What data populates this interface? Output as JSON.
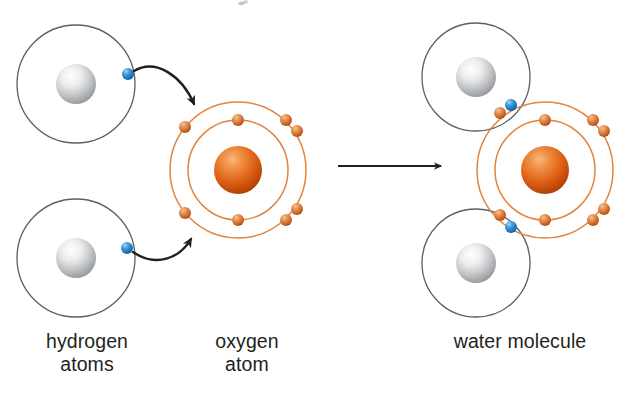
{
  "figure": {
    "background": "#ffffff",
    "width": 624,
    "height": 402
  },
  "colors": {
    "hydrogen_shell_stroke": "#5a5f66",
    "hydrogen_nucleus_light": "#ffffff",
    "hydrogen_nucleus_mid": "#c9cacb",
    "hydrogen_nucleus_dark": "#8d9094",
    "oxygen_shell_stroke": "#e2843c",
    "oxygen_nucleus_light": "#f0a05a",
    "oxygen_nucleus_mid": "#de5f14",
    "oxygen_nucleus_dark": "#b03c07",
    "oxygen_electron_light": "#f0a163",
    "oxygen_electron_mid": "#d2622a",
    "oxygen_electron_dark": "#a2430f",
    "shared_electron_light": "#7fc4e8",
    "shared_electron_mid": "#1f7fc4",
    "shared_electron_dark": "#11558a",
    "arrow": "#231f20",
    "caption_text": "#231f20"
  },
  "labels": {
    "hydrogen_atoms": "hydrogen\natoms",
    "oxygen_atom": "oxygen\natom",
    "water_molecule": "water molecule"
  },
  "icons": {
    "reaction_arrow": "right-arrow-icon",
    "electron_transfer_upper": "curved-arrow-icon",
    "electron_transfer_lower": "curved-arrow-icon"
  },
  "reactants": {
    "hydrogen_atoms": [
      {
        "name": "hydrogen-atom-upper",
        "shell": {
          "cx": 76,
          "cy": 84,
          "r": 59
        },
        "nucleus": {
          "cx": 76,
          "cy": 84,
          "r": 20
        },
        "electrons": [
          {
            "cx": 128,
            "cy": 74,
            "r": 6,
            "type": "shared"
          }
        ]
      },
      {
        "name": "hydrogen-atom-lower",
        "shell": {
          "cx": 76,
          "cy": 258,
          "r": 59
        },
        "nucleus": {
          "cx": 76,
          "cy": 258,
          "r": 20
        },
        "electrons": [
          {
            "cx": 127,
            "cy": 248,
            "r": 6,
            "type": "shared"
          }
        ]
      }
    ],
    "oxygen_atom": {
      "name": "oxygen-atom",
      "nucleus": {
        "cx": 238,
        "cy": 170,
        "r": 24
      },
      "inner_shell": {
        "cx": 238,
        "cy": 170,
        "r": 50
      },
      "outer_shell": {
        "cx": 238,
        "cy": 170,
        "r": 68
      },
      "inner_electrons": [
        {
          "cx": 238,
          "cy": 120,
          "r": 6
        },
        {
          "cx": 238,
          "cy": 220,
          "r": 6
        }
      ],
      "outer_electrons": [
        {
          "cx": 185,
          "cy": 127,
          "r": 6
        },
        {
          "cx": 185,
          "cy": 213,
          "r": 6
        },
        {
          "cx": 286,
          "cy": 120,
          "r": 6
        },
        {
          "cx": 297,
          "cy": 131,
          "r": 6
        },
        {
          "cx": 297,
          "cy": 209,
          "r": 6
        },
        {
          "cx": 286,
          "cy": 220,
          "r": 6
        }
      ]
    }
  },
  "product": {
    "name": "water-molecule",
    "oxygen_atom": {
      "nucleus": {
        "cx": 545,
        "cy": 170,
        "r": 24
      },
      "inner_shell": {
        "cx": 545,
        "cy": 170,
        "r": 50
      },
      "outer_shell": {
        "cx": 545,
        "cy": 170,
        "r": 68
      },
      "inner_electrons": [
        {
          "cx": 545,
          "cy": 120,
          "r": 6
        },
        {
          "cx": 545,
          "cy": 220,
          "r": 6
        }
      ],
      "outer_electrons": [
        {
          "cx": 500,
          "cy": 113,
          "r": 6
        },
        {
          "cx": 500,
          "cy": 215,
          "r": 6
        },
        {
          "cx": 593,
          "cy": 120,
          "r": 6
        },
        {
          "cx": 604,
          "cy": 131,
          "r": 6
        },
        {
          "cx": 604,
          "cy": 209,
          "r": 6
        },
        {
          "cx": 593,
          "cy": 220,
          "r": 6
        }
      ]
    },
    "hydrogen_atoms": [
      {
        "name": "bonded-hydrogen-upper",
        "shell": {
          "cx": 476,
          "cy": 77,
          "r": 54
        },
        "nucleus": {
          "cx": 476,
          "cy": 77,
          "r": 20
        },
        "shared_electron": {
          "cx": 511,
          "cy": 105,
          "r": 6
        }
      },
      {
        "name": "bonded-hydrogen-lower",
        "shell": {
          "cx": 476,
          "cy": 263,
          "r": 54
        },
        "nucleus": {
          "cx": 476,
          "cy": 263,
          "r": 20
        },
        "shared_electron": {
          "cx": 511,
          "cy": 227,
          "r": 6
        }
      }
    ]
  },
  "reaction_arrow": {
    "x1": 338,
    "y1": 166,
    "x2": 443,
    "y2": 166
  }
}
